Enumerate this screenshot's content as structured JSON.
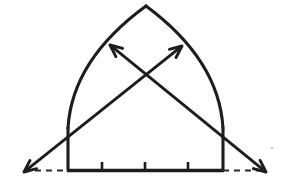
{
  "figure": {
    "background_color": "#ffffff",
    "ink_color": "#1d1d1d",
    "dash_color": "#2a2a2a",
    "width": 287,
    "height": 190
  },
  "chart_data": {
    "type": "diagram",
    "xlabel": "",
    "ylabel": "",
    "grid": false,
    "legend": "none",
    "apex": {
      "x": 146,
      "y": 6
    },
    "springing_left": {
      "x": 68,
      "y": 170
    },
    "springing_right": {
      "x": 223,
      "y": 170
    },
    "baseline_y": 170,
    "left_arc": {
      "from": [
        68,
        170
      ],
      "to": [
        146,
        6
      ],
      "control": [
        72,
        60
      ]
    },
    "right_arc": {
      "from": [
        223,
        170
      ],
      "to": [
        146,
        6
      ],
      "control": [
        219,
        60
      ]
    },
    "left_leg": {
      "from": [
        68,
        170
      ],
      "to": [
        68,
        128
      ]
    },
    "right_leg": {
      "from": [
        223,
        170
      ],
      "to": [
        223,
        128
      ]
    },
    "baseline": {
      "from": [
        68,
        170
      ],
      "to": [
        223,
        170
      ]
    },
    "dashed_segments": [
      {
        "from": [
          24,
          170
        ],
        "to": [
          68,
          170
        ]
      },
      {
        "from": [
          223,
          170
        ],
        "to": [
          266,
          170
        ]
      }
    ],
    "diagonals": [
      {
        "name": "left-to-upper-right",
        "from": [
          24,
          172
        ],
        "to": [
          182,
          46
        ],
        "arrows": [
          "both"
        ]
      },
      {
        "name": "right-to-upper-left",
        "from": [
          266,
          172
        ],
        "to": [
          110,
          45
        ],
        "arrows": [
          "both"
        ]
      }
    ],
    "arrow_tips": [
      {
        "name": "upper-left-arrow-tip",
        "x": 110,
        "y": 45
      },
      {
        "name": "upper-right-arrow-tip",
        "x": 182,
        "y": 46
      },
      {
        "name": "lower-left-arrow-tip",
        "x": 24,
        "y": 172
      },
      {
        "name": "lower-right-arrow-tip",
        "x": 266,
        "y": 172
      }
    ],
    "baseline_ticks": [
      {
        "x": 102,
        "y": 170,
        "height": 8
      },
      {
        "x": 145,
        "y": 170,
        "height": 8
      },
      {
        "x": 188,
        "y": 170,
        "height": 8
      }
    ],
    "tick_count": 3,
    "crossing_point": {
      "x": 145,
      "y": 78
    }
  }
}
